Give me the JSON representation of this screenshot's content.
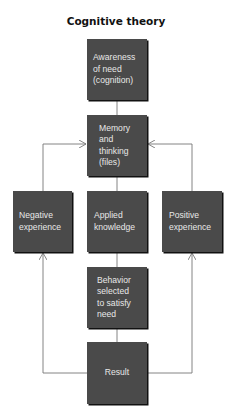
{
  "title": "Cognitive theory",
  "boxes": {
    "awareness": "Awareness\nof need\n(cognition)",
    "memory": "Memory\nand\nthinking\n(files)",
    "negative": "Negative\nexperience",
    "applied": "Applied\nknowledge",
    "positive": "Positive\nexperience",
    "behavior": "Behavior\nselected\nto satisfy\nneed",
    "result": "Result"
  },
  "colors": {
    "box_fill": "#4a4a4a",
    "box_text": "#e8e8e8",
    "line": "#777777"
  }
}
